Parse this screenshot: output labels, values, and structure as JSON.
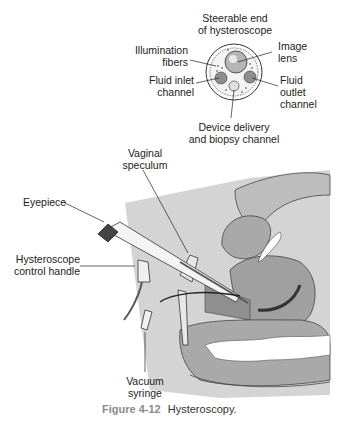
{
  "figure": {
    "number": "Figure 4-12",
    "title": "Hysteroscopy."
  },
  "cross_section": {
    "title_line1": "Steerable end",
    "title_line2": "of hysteroscope",
    "labels": {
      "illumination_line1": "Illumination",
      "illumination_line2": "fibers",
      "image_lens_line1": "Image",
      "image_lens_line2": "lens",
      "fluid_inlet_line1": "Fluid inlet",
      "fluid_inlet_line2": "channel",
      "fluid_outlet_line1": "Fluid",
      "fluid_outlet_line2": "outlet",
      "fluid_outlet_line3": "channel",
      "device_line1": "Device delivery",
      "device_line2": "and biopsy channel"
    }
  },
  "main_illustration": {
    "labels": {
      "speculum_line1": "Vaginal",
      "speculum_line2": "speculum",
      "eyepiece": "Eyepiece",
      "handle_line1": "Hysteroscope",
      "handle_line2": "control handle",
      "syringe_line1": "Vacuum",
      "syringe_line2": "syringe"
    }
  },
  "colors": {
    "tissue_dark": "#8f8f8f",
    "tissue_mid": "#a9a9a9",
    "tissue_light": "#cfcfcf",
    "background_panel": "#d4d4d4",
    "line": "#222222"
  }
}
